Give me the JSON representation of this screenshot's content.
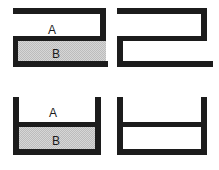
{
  "figure": {
    "background_color": "#ffffff",
    "stroke_color": "#1c1c1c",
    "fill_gray": "#d4d4d4",
    "fill_white": "#ffffff",
    "columns": 2,
    "rows": 2
  },
  "panels": [
    {
      "id": "top-left",
      "name": "s-shape-labeled",
      "shape": "s-channel",
      "orientation": "upper-chamber-open-left",
      "labeled": true,
      "chambers": [
        {
          "key": "A",
          "label": "A",
          "fill": "white"
        },
        {
          "key": "B",
          "label": "B",
          "fill": "gray-hatched"
        }
      ]
    },
    {
      "id": "top-right",
      "name": "s-shape-plain",
      "shape": "s-channel",
      "orientation": "upper-chamber-open-right",
      "labeled": false,
      "chambers": [
        {
          "key": "A",
          "label": "",
          "fill": "white"
        },
        {
          "key": "B",
          "label": "",
          "fill": "white"
        }
      ]
    },
    {
      "id": "bottom-left",
      "name": "u-shape-labeled",
      "shape": "u-channel",
      "orientation": "open-top",
      "labeled": true,
      "chambers": [
        {
          "key": "A",
          "label": "A",
          "fill": "white"
        },
        {
          "key": "B",
          "label": "B",
          "fill": "gray-hatched"
        }
      ]
    },
    {
      "id": "bottom-right",
      "name": "u-shape-plain",
      "shape": "u-channel",
      "orientation": "open-top",
      "labeled": false,
      "chambers": [
        {
          "key": "A",
          "label": "",
          "fill": "white"
        },
        {
          "key": "B",
          "label": "",
          "fill": "white"
        }
      ]
    }
  ],
  "labels": {
    "top_left_a": "A",
    "top_left_b": "B",
    "bottom_left_a": "A",
    "bottom_left_b": "B"
  }
}
